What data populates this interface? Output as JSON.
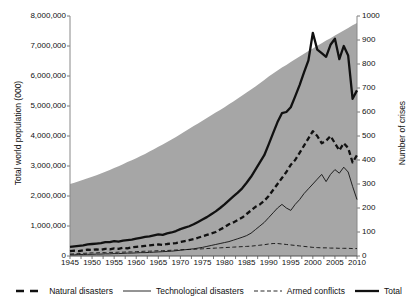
{
  "chart_data": {
    "type": "line",
    "title": "",
    "xlabel": "",
    "ylabel": "Total world population (000)",
    "ylabel_right": "Number of crises",
    "xlim": [
      1945,
      2010
    ],
    "ylim": [
      0,
      8000000
    ],
    "ylim_right": [
      0,
      1000
    ],
    "grid": false,
    "legend_position": "bottom",
    "xticks": [
      1945,
      1950,
      1955,
      1960,
      1965,
      1970,
      1975,
      1980,
      1985,
      1990,
      1995,
      2000,
      2005,
      2010
    ],
    "yticks_left": [
      "0",
      "1,000,000",
      "2,000,000",
      "3,000,000",
      "4,000,000",
      "5,000,000",
      "6,000,000",
      "7,000,000",
      "8,000,000"
    ],
    "yticks_right": [
      "0",
      "100",
      "200",
      "300",
      "400",
      "500",
      "600",
      "700",
      "800",
      "900",
      "1000"
    ],
    "x": [
      1945,
      1946,
      1947,
      1948,
      1949,
      1950,
      1951,
      1952,
      1953,
      1954,
      1955,
      1956,
      1957,
      1958,
      1959,
      1960,
      1961,
      1962,
      1963,
      1964,
      1965,
      1966,
      1967,
      1968,
      1969,
      1970,
      1971,
      1972,
      1973,
      1974,
      1975,
      1976,
      1977,
      1978,
      1979,
      1980,
      1981,
      1982,
      1983,
      1984,
      1985,
      1986,
      1987,
      1988,
      1989,
      1990,
      1991,
      1992,
      1993,
      1994,
      1995,
      1996,
      1997,
      1998,
      1999,
      2000,
      2001,
      2002,
      2003,
      2004,
      2005,
      2006,
      2007,
      2008,
      2009,
      2010
    ],
    "area_series": {
      "name": "Total world population",
      "axis": "left",
      "color": "#a6a6a6",
      "values": [
        2400000,
        2440000,
        2490000,
        2540000,
        2590000,
        2640000,
        2690000,
        2750000,
        2810000,
        2870000,
        2930000,
        2990000,
        3060000,
        3130000,
        3190000,
        3260000,
        3330000,
        3400000,
        3480000,
        3560000,
        3640000,
        3720000,
        3800000,
        3880000,
        3970000,
        4060000,
        4150000,
        4240000,
        4330000,
        4420000,
        4510000,
        4600000,
        4690000,
        4780000,
        4870000,
        4960000,
        5060000,
        5150000,
        5250000,
        5350000,
        5450000,
        5550000,
        5650000,
        5760000,
        5870000,
        5980000,
        6080000,
        6180000,
        6280000,
        6370000,
        6470000,
        6560000,
        6650000,
        6740000,
        6830000,
        6920000,
        7010000,
        7090000,
        7180000,
        7260000,
        7350000,
        7430000,
        7520000,
        7600000,
        7690000,
        7770000
      ]
    },
    "series": [
      {
        "name": "Natural disasters",
        "axis": "right",
        "style": "thick-dashed",
        "color": "#111111",
        "values": [
          20,
          22,
          20,
          24,
          26,
          25,
          28,
          26,
          30,
          28,
          32,
          30,
          34,
          32,
          36,
          38,
          40,
          42,
          44,
          46,
          48,
          46,
          50,
          52,
          54,
          58,
          62,
          66,
          70,
          76,
          82,
          88,
          94,
          100,
          110,
          120,
          132,
          140,
          150,
          160,
          175,
          190,
          205,
          215,
          230,
          250,
          275,
          300,
          325,
          350,
          380,
          400,
          430,
          460,
          490,
          520,
          500,
          470,
          480,
          500,
          470,
          440,
          470,
          450,
          390,
          420
        ]
      },
      {
        "name": "Technological disasters",
        "axis": "right",
        "style": "thin-solid",
        "color": "#111111",
        "values": [
          5,
          5,
          6,
          6,
          7,
          7,
          8,
          8,
          9,
          9,
          10,
          10,
          11,
          12,
          12,
          13,
          14,
          14,
          15,
          16,
          17,
          18,
          19,
          20,
          22,
          24,
          26,
          28,
          30,
          33,
          36,
          40,
          44,
          48,
          52,
          56,
          60,
          66,
          72,
          78,
          85,
          95,
          110,
          125,
          140,
          160,
          180,
          200,
          215,
          200,
          190,
          215,
          235,
          260,
          280,
          300,
          320,
          340,
          310,
          340,
          360,
          345,
          370,
          350,
          290,
          235
        ]
      },
      {
        "name": "Armed conflicts",
        "axis": "right",
        "style": "thin-dashed",
        "color": "#111111",
        "values": [
          8,
          9,
          10,
          11,
          12,
          13,
          13,
          14,
          14,
          15,
          15,
          16,
          16,
          17,
          17,
          18,
          19,
          20,
          20,
          21,
          22,
          22,
          23,
          24,
          25,
          26,
          27,
          27,
          28,
          29,
          30,
          31,
          32,
          33,
          34,
          35,
          36,
          37,
          38,
          39,
          40,
          41,
          43,
          45,
          47,
          50,
          52,
          52,
          50,
          48,
          46,
          44,
          42,
          40,
          38,
          36,
          35,
          34,
          34,
          33,
          33,
          32,
          32,
          32,
          31,
          31
        ]
      },
      {
        "name": "Total",
        "axis": "right",
        "style": "thick-solid",
        "color": "#111111",
        "values": [
          38,
          40,
          42,
          44,
          48,
          50,
          52,
          54,
          58,
          58,
          62,
          60,
          64,
          66,
          68,
          72,
          76,
          80,
          82,
          86,
          90,
          88,
          94,
          98,
          104,
          112,
          118,
          124,
          132,
          142,
          152,
          162,
          174,
          186,
          200,
          215,
          232,
          248,
          264,
          282,
          305,
          330,
          360,
          390,
          420,
          465,
          512,
          558,
          595,
          600,
          620,
          665,
          712,
          765,
          815,
          930,
          860,
          845,
          830,
          880,
          905,
          820,
          875,
          835,
          655,
          690
        ]
      }
    ]
  },
  "legend": {
    "items": [
      {
        "label": "Natural disasters",
        "style": "thick-dashed"
      },
      {
        "label": "Technological disasters",
        "style": "thin-solid"
      },
      {
        "label": "Armed conflicts",
        "style": "thin-dashed"
      },
      {
        "label": "Total",
        "style": "thick-solid"
      }
    ]
  },
  "axes": {
    "left_title": "Total world population (000)",
    "right_title": "Number of crises"
  }
}
